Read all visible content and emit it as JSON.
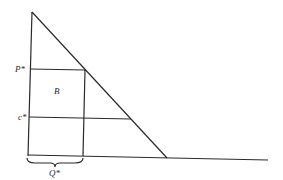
{
  "diagram": {
    "labels": {
      "price": "P*",
      "cost": "c*",
      "area": "B",
      "quantity": "Q*"
    },
    "colors": {
      "line": "#2a2a2a",
      "background": "#ffffff"
    }
  }
}
